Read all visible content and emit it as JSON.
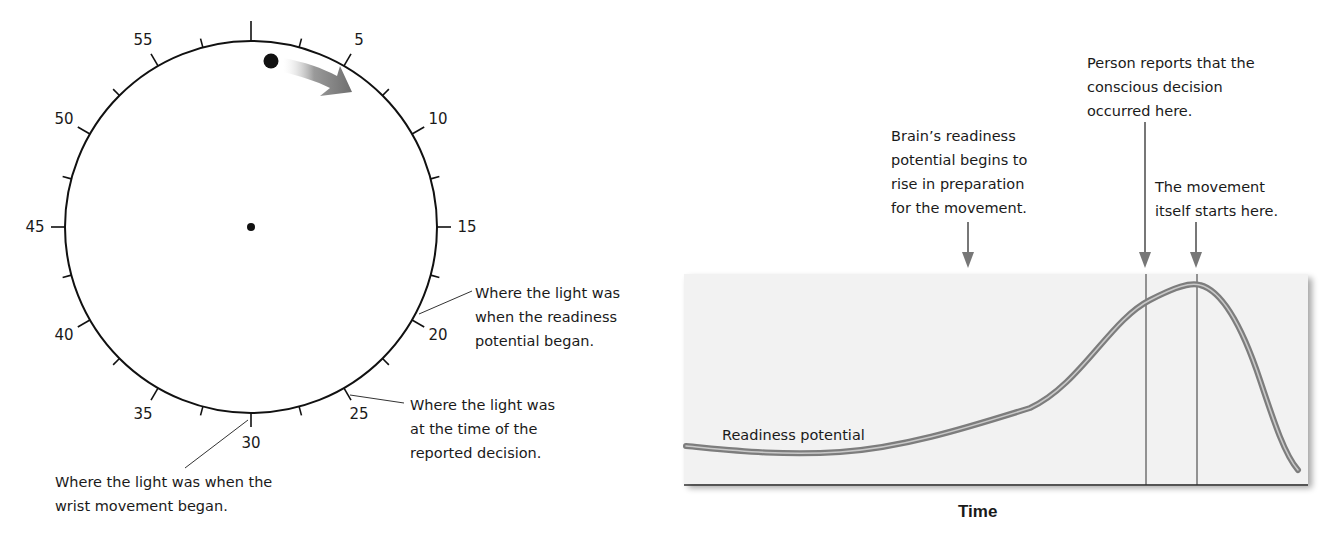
{
  "clock": {
    "tick_labels": [
      {
        "value": "5",
        "minute": 5
      },
      {
        "value": "10",
        "minute": 10
      },
      {
        "value": "15",
        "minute": 15
      },
      {
        "value": "20",
        "minute": 20
      },
      {
        "value": "25",
        "minute": 25
      },
      {
        "value": "30",
        "minute": 30
      },
      {
        "value": "35",
        "minute": 35
      },
      {
        "value": "40",
        "minute": 40
      },
      {
        "value": "45",
        "minute": 45
      },
      {
        "value": "50",
        "minute": 50
      },
      {
        "value": "55",
        "minute": 55
      }
    ],
    "annotations": {
      "readiness_began": [
        "Where the light was",
        "when the readiness",
        "potential began."
      ],
      "reported_decision": [
        "Where the light was",
        "at the time of the",
        "reported decision."
      ],
      "wrist_movement": [
        "Where the light was when the",
        "wrist movement began."
      ]
    },
    "arrow_color": "#7a7a7a"
  },
  "chart": {
    "annotations": {
      "readiness_rise": [
        "Brain’s readiness",
        "potential begins to",
        "rise in preparation",
        "for the movement."
      ],
      "conscious_decision": [
        "Person reports that the",
        "conscious decision",
        "occurred here."
      ],
      "movement_start": [
        "The movement",
        "itself starts here."
      ]
    },
    "curve_label": "Readiness potential",
    "x_axis_title": "Time",
    "panel_color": "#f3f3f3",
    "curve_color": "#8c8c8c"
  },
  "chart_data": {
    "type": "line",
    "title": "",
    "xlabel": "Time",
    "ylabel": "",
    "series": [
      {
        "name": "Readiness potential",
        "x": [
          0,
          10,
          20,
          30,
          40,
          50,
          55,
          60,
          65,
          70,
          75,
          80,
          85,
          88,
          92,
          96,
          100
        ],
        "y": [
          18,
          15,
          14,
          17,
          26,
          36,
          44,
          58,
          72,
          84,
          94,
          98,
          96,
          80,
          50,
          22,
          10
        ]
      }
    ],
    "markers": [
      {
        "x": 46,
        "label": "Brain's readiness potential begins to rise in preparation for the movement."
      },
      {
        "x": 73,
        "label": "Person reports that the conscious decision occurred here."
      },
      {
        "x": 81,
        "label": "The movement itself starts here."
      }
    ],
    "grid": false,
    "legend": "none"
  }
}
